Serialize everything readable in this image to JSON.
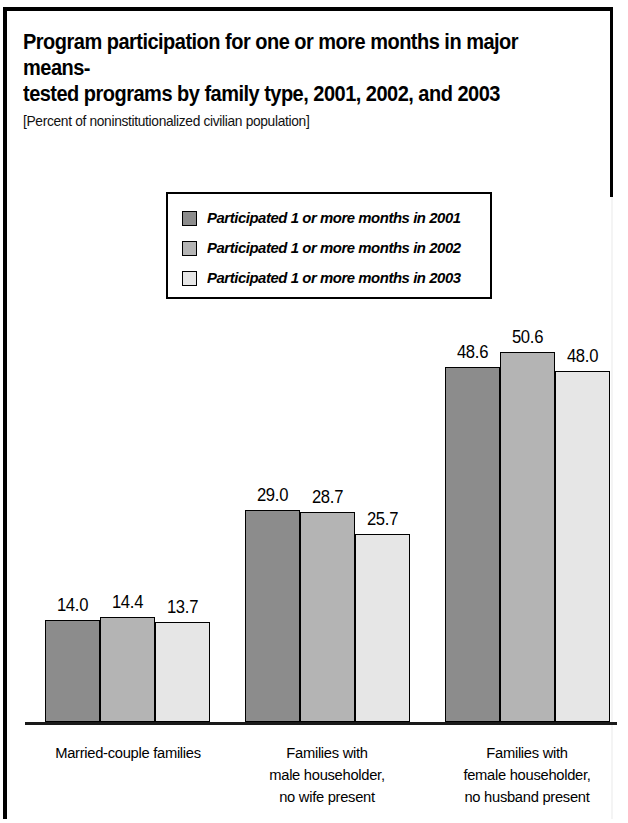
{
  "figure": {
    "title": "Program participation for one or more months in major means-\ntested programs by family type, 2001, 2002, and 2003",
    "subtitle": "[Percent of noninstitutionalized civilian population]"
  },
  "legend": {
    "position": "inside-top-center",
    "items": [
      {
        "label": "Participated 1 or more months in 2001",
        "color": "#8c8c8c",
        "swatch_name": "legend-swatch-2001"
      },
      {
        "label": "Participated 1 or more months in 2002",
        "color": "#b4b4b4",
        "swatch_name": "legend-swatch-2002"
      },
      {
        "label": "Participated 1 or more months in 2003",
        "color": "#e6e6e6",
        "swatch_name": "legend-swatch-2003"
      }
    ]
  },
  "chart_data": {
    "type": "bar",
    "subtitle": "[Percent of noninstitutionalized civilian population]",
    "xlabel": "",
    "ylabel": "Percent",
    "ylim": [
      0,
      52
    ],
    "grid": false,
    "axis": "baseline-only",
    "categories": [
      "Married-couple families",
      "Families with\nmale householder,\nno wife present",
      "Families with\nfemale householder,\nno husband present"
    ],
    "series": [
      {
        "name": "Participated 1 or more months in 2001",
        "color": "#8c8c8c",
        "values": [
          14.0,
          29.0,
          48.6
        ]
      },
      {
        "name": "Participated 1 or more months in 2002",
        "color": "#b4b4b4",
        "values": [
          14.4,
          28.7,
          50.6
        ]
      },
      {
        "name": "Participated 1 or more months in 2003",
        "color": "#e6e6e6",
        "values": [
          13.7,
          25.7,
          48.0
        ]
      }
    ],
    "value_labels": [
      [
        "14.0",
        "14.4",
        "13.7"
      ],
      [
        "29.0",
        "28.7",
        "25.7"
      ],
      [
        "48.6",
        "50.6",
        "48.0"
      ]
    ]
  },
  "layout": {
    "baseline_y": 711,
    "px_per_unit": 7.31,
    "groups": [
      {
        "x": 38,
        "label_center": 121,
        "label_top": 731
      },
      {
        "x": 238,
        "label_center": 320,
        "label_top": 731
      },
      {
        "x": 438,
        "label_center": 520,
        "label_top": 731
      }
    ],
    "bar_width": 55
  }
}
